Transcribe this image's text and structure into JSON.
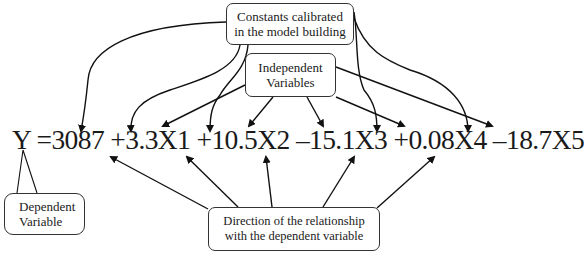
{
  "boxes": {
    "constants": {
      "line1": "Constants calibrated",
      "line2": "in the model building"
    },
    "independent": {
      "line1": "Independent",
      "line2": "Variables"
    },
    "dependent": {
      "line1": "Dependent",
      "line2": "Variable"
    },
    "direction": {
      "line1": "Direction of the relationship",
      "line2": "with the dependent variable"
    }
  },
  "equation": {
    "lhs": "Y",
    "equals": "=",
    "intercept": "3087",
    "terms": [
      {
        "sign": "+",
        "coef": "3.3",
        "var": "X1"
      },
      {
        "sign": "+",
        "coef": "10.5",
        "var": "X2"
      },
      {
        "sign": "–",
        "coef": "15.1",
        "var": "X3"
      },
      {
        "sign": "+",
        "coef": "0.08",
        "var": "X4"
      },
      {
        "sign": "–",
        "coef": "18.7",
        "var": "X5"
      }
    ]
  }
}
